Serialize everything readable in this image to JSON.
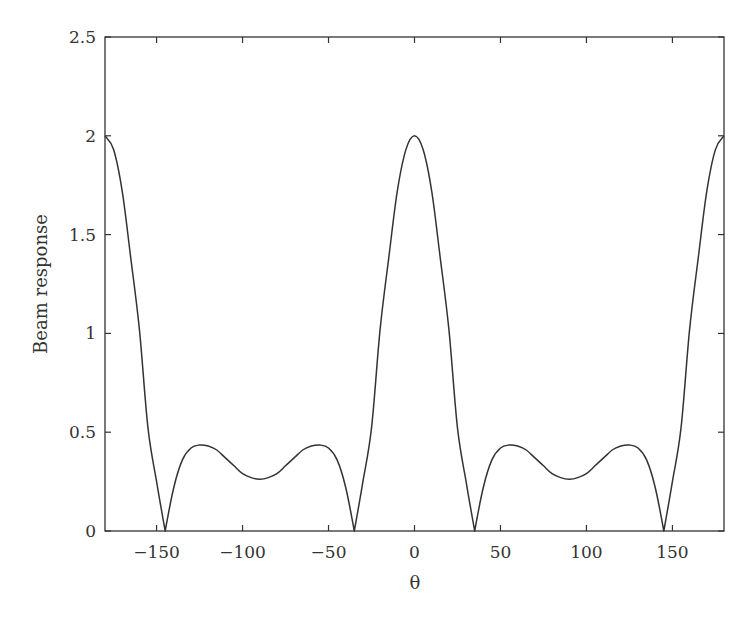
{
  "chart_data": {
    "type": "line",
    "title": "",
    "xlabel": "θ",
    "ylabel": "Beam response",
    "xlim": [
      -180,
      180
    ],
    "ylim": [
      0,
      2.5
    ],
    "grid": false,
    "legend": null,
    "xticks": [
      -150,
      -100,
      -50,
      0,
      50,
      100,
      150
    ],
    "xtick_labels": [
      "−150",
      "−100",
      "−50",
      "0",
      "50",
      "100",
      "150"
    ],
    "yticks": [
      0,
      0.5,
      1,
      1.5,
      2,
      2.5
    ],
    "ytick_labels": [
      "0",
      "0.5",
      "1",
      "1.5",
      "2",
      "2.5"
    ],
    "series": [
      {
        "name": "Beam response",
        "color": "#333333",
        "x": [
          -180,
          -175,
          -170,
          -165,
          -160,
          -155,
          -150,
          -145,
          -140,
          -135,
          -130,
          -125,
          -120,
          -115,
          -110,
          -105,
          -100,
          -95,
          -90,
          -85,
          -80,
          -75,
          -70,
          -65,
          -60,
          -55,
          -50,
          -45,
          -40,
          -35,
          -30,
          -25,
          -20,
          -15,
          -10,
          -5,
          0,
          5,
          10,
          15,
          20,
          25,
          30,
          35,
          40,
          45,
          50,
          55,
          60,
          65,
          70,
          75,
          80,
          85,
          90,
          95,
          100,
          105,
          110,
          115,
          120,
          125,
          130,
          135,
          140,
          145,
          150,
          155,
          160,
          165,
          170,
          175,
          180
        ],
        "values": [
          2.0,
          1.93,
          1.72,
          1.38,
          1.02,
          0.52,
          0.25,
          0.0,
          0.22,
          0.36,
          0.42,
          0.435,
          0.43,
          0.41,
          0.37,
          0.33,
          0.29,
          0.27,
          0.262,
          0.27,
          0.29,
          0.33,
          0.37,
          0.41,
          0.43,
          0.435,
          0.42,
          0.36,
          0.22,
          0.0,
          0.25,
          0.52,
          1.02,
          1.38,
          1.72,
          1.93,
          2.0,
          1.93,
          1.72,
          1.38,
          1.02,
          0.52,
          0.25,
          0.0,
          0.22,
          0.36,
          0.42,
          0.435,
          0.43,
          0.41,
          0.37,
          0.33,
          0.29,
          0.27,
          0.262,
          0.27,
          0.29,
          0.33,
          0.37,
          0.41,
          0.43,
          0.435,
          0.42,
          0.36,
          0.22,
          0.0,
          0.25,
          0.52,
          1.02,
          1.38,
          1.72,
          1.93,
          2.0
        ]
      }
    ]
  }
}
